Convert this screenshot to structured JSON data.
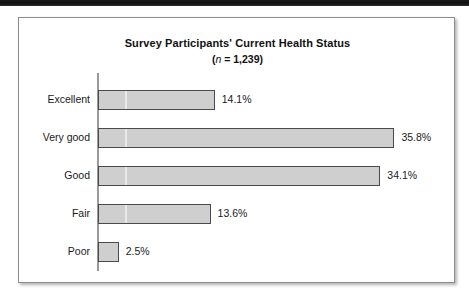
{
  "figure": {
    "title": "Survey Participants' Current Health Status",
    "subtitle_prefix": "(",
    "subtitle_n": "n",
    "subtitle_rest": " = 1,239)"
  },
  "chart_data": {
    "type": "bar",
    "orientation": "horizontal",
    "title": "Survey Participants' Current Health Status",
    "subtitle": "(n = 1,239)",
    "sample_size": 1239,
    "xlabel": "",
    "ylabel": "",
    "xlim": [
      0,
      40
    ],
    "grid": false,
    "legend": null,
    "unit": "%",
    "categories": [
      "Excellent",
      "Very good",
      "Good",
      "Fair",
      "Poor"
    ],
    "values": [
      14.1,
      34.1,
      35.8,
      13.6,
      2.5
    ],
    "bars": [
      {
        "category": "Excellent",
        "value": 14.1,
        "label": "14.1%"
      },
      {
        "category": "Very good",
        "value": 35.8,
        "label": "35.8%"
      },
      {
        "category": "Good",
        "value": 34.1,
        "label": "34.1%"
      },
      {
        "category": "Fair",
        "value": 13.6,
        "label": "13.6%"
      },
      {
        "category": "Poor",
        "value": 2.5,
        "label": "2.5%"
      }
    ],
    "colors": {
      "bar_fill": "#cfcfcf",
      "bar_stroke": "#4a4a4a",
      "axis": "#9a9a9a",
      "text": "#1a1a1a",
      "panel_background": "#ffffff",
      "panel_border": "#8d8d8d"
    }
  }
}
